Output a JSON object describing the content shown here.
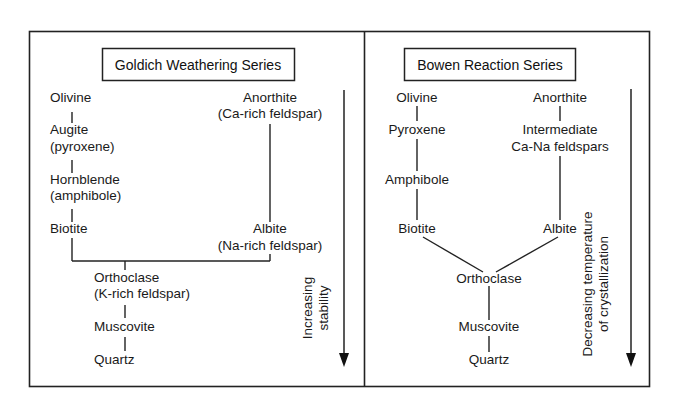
{
  "goldich": {
    "title": "Goldich Weathering Series",
    "mafic": [
      {
        "name": "Olivine",
        "sub": ""
      },
      {
        "name": "Augite",
        "sub": "(pyroxene)"
      },
      {
        "name": "Hornblende",
        "sub": "(amphibole)"
      },
      {
        "name": "Biotite",
        "sub": ""
      }
    ],
    "felsic": [
      {
        "name": "Anorthite",
        "sub": "(Ca-rich feldspar)"
      },
      {
        "name": "Albite",
        "sub": "(Na-rich feldspar)"
      }
    ],
    "common": [
      {
        "name": "Orthoclase",
        "sub": "(K-rich feldspar)"
      },
      {
        "name": "Muscovite",
        "sub": ""
      },
      {
        "name": "Quartz",
        "sub": ""
      }
    ],
    "arrow_label_line1": "Increasing",
    "arrow_label_line2": "stability"
  },
  "bowen": {
    "title": "Bowen Reaction Series",
    "discontinuous": [
      "Olivine",
      "Pyroxene",
      "Amphibole",
      "Biotite"
    ],
    "continuous": [
      {
        "name": "Anorthite",
        "sub": ""
      },
      {
        "name": "Intermediate",
        "sub": "Ca-Na feldspars"
      },
      {
        "name": "Albite",
        "sub": ""
      }
    ],
    "common": [
      "Orthoclase",
      "Muscovite",
      "Quartz"
    ],
    "arrow_label_line1": "Decreasing temperature",
    "arrow_label_line2": "of crystallization"
  },
  "colors": {
    "line": "#1a1a1a",
    "background": "#ffffff"
  }
}
